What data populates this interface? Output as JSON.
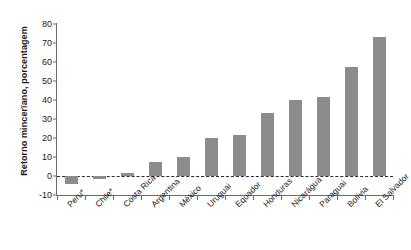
{
  "chart_data": {
    "type": "bar",
    "title": "",
    "xlabel": "",
    "ylabel": "Retorno mincerïano, porcentagem",
    "ylim": [
      -10,
      80
    ],
    "yticks": [
      80,
      70,
      60,
      50,
      40,
      30,
      20,
      10,
      0,
      -10
    ],
    "grid": false,
    "legend": "none",
    "zero_line": true,
    "bar_color": "#8c8c8c",
    "categories": [
      "Peru*",
      "Chile*",
      "Costa Rica",
      "Argentina",
      "México",
      "Uruguai",
      "Equador",
      "Honduras",
      "Nicarágua",
      "Paraguai",
      "Bolívia",
      "El Salvador"
    ],
    "values": [
      -4,
      -1.5,
      1.5,
      7.5,
      10,
      20,
      21.5,
      33,
      40,
      41.5,
      57.5,
      73
    ]
  }
}
